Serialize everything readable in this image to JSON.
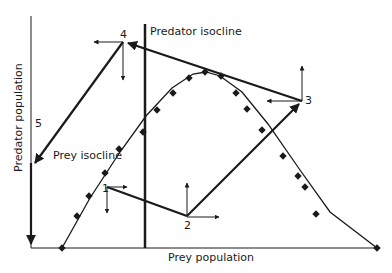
{
  "labels": {
    "x_axis": "Prey population",
    "y_axis": "Predator population",
    "predator_isocline": "Predator isocline",
    "prey_isocline": "Prey isocline"
  },
  "points": [
    {
      "id": "1",
      "label": "1",
      "x": 105,
      "y": 187
    },
    {
      "id": "2",
      "label": "2",
      "x": 187,
      "y": 217
    },
    {
      "id": "3",
      "label": "3",
      "x": 302,
      "y": 101
    },
    {
      "id": "4",
      "label": "4",
      "x": 123,
      "y": 42
    },
    {
      "id": "5",
      "label": "5",
      "x": 33,
      "y": 167
    }
  ],
  "colors": {
    "ink": "#1a1a1a",
    "background": "#ffffff"
  }
}
